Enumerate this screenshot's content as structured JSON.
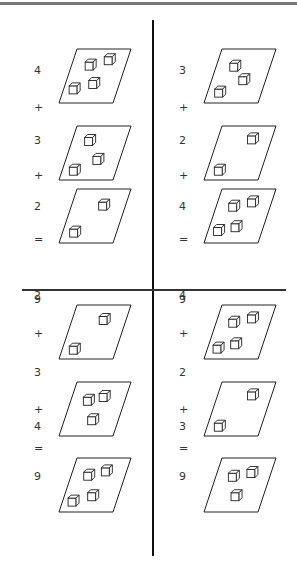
{
  "quadrants": [
    {
      "id": "top-left",
      "terms": [
        4,
        3,
        2
      ],
      "ops": [
        "+",
        "+",
        "="
      ],
      "total": "9",
      "labels": [
        "4",
        "3",
        "2"
      ],
      "cubes": [
        [
          [
            0.3,
            0.28
          ],
          [
            0.62,
            0.18
          ],
          [
            0.15,
            0.72
          ],
          [
            0.48,
            0.62
          ]
        ],
        [
          [
            0.28,
            0.25
          ],
          [
            0.55,
            0.6
          ],
          [
            0.18,
            0.8
          ]
        ],
        [
          [
            0.55,
            0.28
          ],
          [
            0.18,
            0.78
          ]
        ]
      ]
    },
    {
      "id": "top-right",
      "terms": [
        3,
        2,
        4
      ],
      "ops": [
        "+",
        "+",
        "="
      ],
      "total": "9",
      "labels": [
        "3",
        "2",
        "4"
      ],
      "cubes": [
        [
          [
            0.3,
            0.3
          ],
          [
            0.55,
            0.55
          ],
          [
            0.18,
            0.78
          ]
        ],
        [
          [
            0.6,
            0.22
          ],
          [
            0.18,
            0.8
          ]
        ],
        [
          [
            0.28,
            0.3
          ],
          [
            0.6,
            0.22
          ],
          [
            0.15,
            0.75
          ],
          [
            0.45,
            0.68
          ]
        ]
      ]
    },
    {
      "id": "bottom-left",
      "terms": [
        2,
        3,
        4
      ],
      "ops": [
        "+",
        "+",
        "="
      ],
      "total": "9",
      "labels": [
        "2",
        "3",
        "4"
      ],
      "cubes": [
        [
          [
            0.55,
            0.25
          ],
          [
            0.18,
            0.8
          ]
        ],
        [
          [
            0.28,
            0.32
          ],
          [
            0.55,
            0.25
          ],
          [
            0.48,
            0.68
          ]
        ],
        [
          [
            0.28,
            0.3
          ],
          [
            0.58,
            0.22
          ],
          [
            0.15,
            0.78
          ],
          [
            0.48,
            0.68
          ]
        ]
      ]
    },
    {
      "id": "bottom-right",
      "terms": [
        4,
        2,
        3
      ],
      "ops": [
        "+",
        "+",
        "="
      ],
      "total": "9",
      "labels": [
        "4",
        "2",
        "3"
      ],
      "cubes": [
        [
          [
            0.28,
            0.3
          ],
          [
            0.6,
            0.22
          ],
          [
            0.15,
            0.78
          ],
          [
            0.45,
            0.7
          ]
        ],
        [
          [
            0.6,
            0.22
          ],
          [
            0.18,
            0.8
          ]
        ],
        [
          [
            0.28,
            0.32
          ],
          [
            0.6,
            0.25
          ],
          [
            0.45,
            0.68
          ]
        ]
      ]
    }
  ],
  "colors": {
    "line": "#111111",
    "border": "#777777",
    "text": "#333333"
  }
}
